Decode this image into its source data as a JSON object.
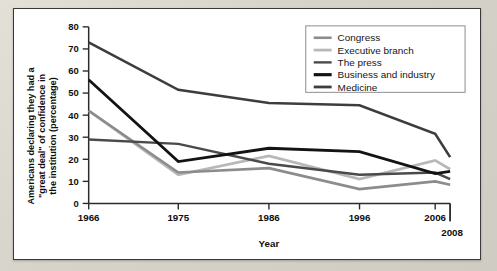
{
  "chart_data": {
    "type": "line",
    "title": "",
    "xlabel": "Year",
    "ylabel": "Americans declaring they had a \"great deal\" of confidence in the institution (percentage)",
    "ylabel_lines": [
      "Americans declaring they had a",
      "\"great deal\" of confidence in",
      "the institution (percentage)"
    ],
    "categories": [
      "1966",
      "1975",
      "1986",
      "1996",
      "2006",
      "2008"
    ],
    "x": [
      1966,
      1975,
      1986,
      1996,
      2006,
      2008
    ],
    "xlim": [
      1966,
      2008
    ],
    "ylim": [
      0,
      80
    ],
    "yticks": [
      0,
      10,
      20,
      30,
      40,
      50,
      60,
      70,
      80
    ],
    "xticks": [
      1966,
      1975,
      1986,
      1996,
      2006,
      2008
    ],
    "grid": false,
    "legend_position": "top-right",
    "series": [
      {
        "name": "Congress",
        "color": "#8c8c8c",
        "width": 2.6,
        "values": [
          42,
          14,
          16,
          6.5,
          10,
          8.5
        ]
      },
      {
        "name": "Executive branch",
        "color": "#b8b8b8",
        "width": 2.8,
        "values": [
          42,
          13,
          21.5,
          11,
          19.5,
          15.5
        ]
      },
      {
        "name": "The press",
        "color": "#4a4a4a",
        "width": 2.4,
        "values": [
          29,
          27,
          18,
          13,
          14,
          11
        ]
      },
      {
        "name": "Business and industry",
        "color": "#131313",
        "width": 2.8,
        "values": [
          56,
          19,
          25,
          23.5,
          13.5,
          14.5
        ]
      },
      {
        "name": "Medicine",
        "color": "#3d3d3d",
        "width": 2.6,
        "values": [
          73,
          51.5,
          45.5,
          44.5,
          31.5,
          21
        ]
      }
    ]
  },
  "legend": {
    "items": [
      {
        "label": "Congress",
        "color": "#8c8c8c",
        "width": 2.6
      },
      {
        "label": "Executive branch",
        "color": "#b8b8b8",
        "width": 2.8
      },
      {
        "label": "The press",
        "color": "#4a4a4a",
        "width": 2.4
      },
      {
        "label": "Business and industry",
        "color": "#131313",
        "width": 3.2
      },
      {
        "label": "Medicine",
        "color": "#3d3d3d",
        "width": 2.8
      }
    ]
  },
  "style": {
    "panel_background": "#ffffff",
    "page_background": "#d9d6ce",
    "axis_color": "#2b2b2b",
    "text_color": "#0d0d0d"
  }
}
